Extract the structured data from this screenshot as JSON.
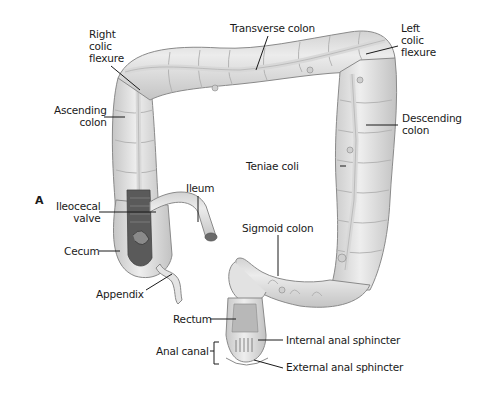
{
  "figure": {
    "panel_letter": "A",
    "colors": {
      "colon_fill": "#e6e6e6",
      "colon_shade": "#c8c8c8",
      "colon_stroke": "#8a8a8a",
      "taenia": "#d6d6d6",
      "interior_dark": "#5a5a5a",
      "leader_line": "#1a1a1a"
    },
    "labels": {
      "right_colic_flexure": "Right\ncolic\nflexure",
      "transverse_colon": "Transverse colon",
      "left_colic_flexure": "Left\ncolic\nflexure",
      "ascending_colon": "Ascending\ncolon",
      "descending_colon": "Descending\ncolon",
      "teniae_coli": "Teniae coli",
      "ileum": "Ileum",
      "ileocecal_valve": "Ileocecal\nvalve",
      "sigmoid_colon": "Sigmoid colon",
      "cecum": "Cecum",
      "appendix": "Appendix",
      "rectum": "Rectum",
      "internal_anal_sphincter": "Internal anal sphincter",
      "anal_canal": "Anal canal",
      "external_anal_sphincter": "External anal sphincter"
    }
  }
}
